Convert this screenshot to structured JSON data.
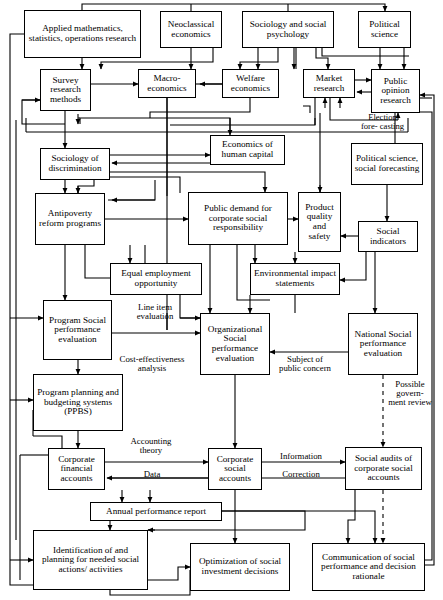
{
  "diagram": {
    "background_color": "#ffffff",
    "line_color": "#000000",
    "nodes": [
      {
        "id": "applied_math",
        "label": "Applied mathematics, statistics, operations research",
        "x": 24,
        "y": 10,
        "w": 117,
        "h": 48,
        "font": 9.2
      },
      {
        "id": "neoclassical",
        "label": "Neoclassical economics",
        "x": 160,
        "y": 11,
        "w": 62,
        "h": 37,
        "font": 9.2
      },
      {
        "id": "sociology_psych",
        "label": "Sociology and social psychology",
        "x": 242,
        "y": 11,
        "w": 92,
        "h": 37,
        "font": 9.2
      },
      {
        "id": "political_science",
        "label": "Political science",
        "x": 358,
        "y": 11,
        "w": 53,
        "h": 37,
        "font": 9.2
      },
      {
        "id": "survey_research",
        "label": "Survey research methods",
        "x": 40,
        "y": 69,
        "w": 51,
        "h": 42,
        "font": 9.2
      },
      {
        "id": "macro_econ",
        "label": "Macro- economics",
        "x": 138,
        "y": 69,
        "w": 58,
        "h": 29,
        "font": 9.2
      },
      {
        "id": "welfare_econ",
        "label": "Welfare economics",
        "x": 222,
        "y": 69,
        "w": 57,
        "h": 29,
        "font": 9.2
      },
      {
        "id": "market_research",
        "label": "Market research",
        "x": 303,
        "y": 69,
        "w": 52,
        "h": 29,
        "font": 9.2
      },
      {
        "id": "public_opinion",
        "label": "Public opinion research",
        "x": 371,
        "y": 69,
        "w": 49,
        "h": 44,
        "font": 9.2
      },
      {
        "id": "econ_human_cap",
        "label": "Economics of human capital",
        "x": 210,
        "y": 135,
        "w": 75,
        "h": 30,
        "font": 9.2
      },
      {
        "id": "political_forecast",
        "label": "Political science, social forecasting",
        "x": 351,
        "y": 143,
        "w": 72,
        "h": 42,
        "font": 9.2
      },
      {
        "id": "sociology_discrim",
        "label": "Sociology of discrimination",
        "x": 40,
        "y": 148,
        "w": 70,
        "h": 32,
        "font": 9.2
      },
      {
        "id": "antipoverty",
        "label": "Antipoverty reform programs",
        "x": 35,
        "y": 193,
        "w": 70,
        "h": 52,
        "font": 9.2
      },
      {
        "id": "public_demand",
        "label": "Public demand for corporate social responsibility",
        "x": 188,
        "y": 192,
        "w": 100,
        "h": 53,
        "font": 9.2
      },
      {
        "id": "product_quality",
        "label": "Product quality and safety",
        "x": 298,
        "y": 192,
        "w": 43,
        "h": 60,
        "font": 9.2
      },
      {
        "id": "social_indicators",
        "label": "Social indicators",
        "x": 358,
        "y": 221,
        "w": 60,
        "h": 31,
        "font": 9.2
      },
      {
        "id": "equal_employment",
        "label": "Equal employment opportunity",
        "x": 110,
        "y": 263,
        "w": 92,
        "h": 32,
        "font": 9.2
      },
      {
        "id": "environmental",
        "label": "Environmental impact statements",
        "x": 250,
        "y": 263,
        "w": 90,
        "h": 32,
        "font": 9.2
      },
      {
        "id": "program_spe",
        "label": "Program Social performance evaluation",
        "x": 43,
        "y": 300,
        "w": 69,
        "h": 60,
        "font": 9.2
      },
      {
        "id": "organizational_spe",
        "label": "Organizational Social performance evaluation",
        "x": 200,
        "y": 313,
        "w": 70,
        "h": 62,
        "font": 9.2
      },
      {
        "id": "national_spe",
        "label": "National Social performance evaluation",
        "x": 348,
        "y": 313,
        "w": 70,
        "h": 62,
        "font": 9.2
      },
      {
        "id": "ppbs",
        "label": "Program planning and budgeting systems (PPBS)",
        "x": 33,
        "y": 374,
        "w": 90,
        "h": 57,
        "font": 9.2
      },
      {
        "id": "corp_financial",
        "label": "Corporate financial accounts",
        "x": 48,
        "y": 448,
        "w": 57,
        "h": 42,
        "font": 9.2
      },
      {
        "id": "corp_social",
        "label": "Corporate social accounts",
        "x": 208,
        "y": 448,
        "w": 54,
        "h": 42,
        "font": 9.2
      },
      {
        "id": "social_audits",
        "label": "Social audits of corporate social accounts",
        "x": 345,
        "y": 447,
        "w": 77,
        "h": 43,
        "font": 9.2
      },
      {
        "id": "annual_report",
        "label": "Annual performance report",
        "x": 90,
        "y": 502,
        "w": 132,
        "h": 19,
        "font": 9.2
      },
      {
        "id": "identification",
        "label": "Identification of and planning for needed social actions/ activities",
        "x": 33,
        "y": 530,
        "w": 115,
        "h": 60,
        "font": 9.2
      },
      {
        "id": "optimization",
        "label": "Optimization of social investment decisions",
        "x": 190,
        "y": 543,
        "w": 100,
        "h": 48,
        "font": 9.2
      },
      {
        "id": "communication",
        "label": "Communication of social performance and decision rationale",
        "x": 312,
        "y": 543,
        "w": 113,
        "h": 48,
        "font": 9.2
      }
    ],
    "edge_labels": [
      {
        "id": "election_forecasting",
        "label": "Election fore- casting",
        "x": 360,
        "y": 113,
        "w": 45,
        "h": 34,
        "font": 8.6
      },
      {
        "id": "line_item",
        "label": "Line item evaluation",
        "x": 122,
        "y": 303,
        "w": 66,
        "h": 22,
        "font": 8.8
      },
      {
        "id": "cost_effectiveness",
        "label": "Cost-effectiveness analysis",
        "x": 110,
        "y": 355,
        "w": 84,
        "h": 22,
        "font": 8.8
      },
      {
        "id": "subject_public",
        "label": "Subject of public concern",
        "x": 275,
        "y": 355,
        "w": 60,
        "h": 34,
        "font": 8.8
      },
      {
        "id": "possible_gov_review",
        "label": "Possible govern- ment review",
        "x": 388,
        "y": 380,
        "w": 44,
        "h": 46,
        "font": 8.8
      },
      {
        "id": "accounting_theory",
        "label": "Accounting theory",
        "x": 120,
        "y": 437,
        "w": 62,
        "h": 22,
        "font": 8.8
      },
      {
        "id": "data_label",
        "label": "Data",
        "x": 137,
        "y": 470,
        "w": 30,
        "h": 12,
        "font": 8.8
      },
      {
        "id": "information_label",
        "label": "Information",
        "x": 272,
        "y": 452,
        "w": 58,
        "h": 12,
        "font": 8.8
      },
      {
        "id": "correction_label",
        "label": "Correction",
        "x": 274,
        "y": 470,
        "w": 54,
        "h": 12,
        "font": 8.8
      }
    ]
  }
}
